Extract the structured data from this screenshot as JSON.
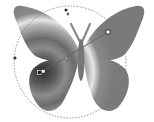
{
  "canvas": {
    "width": 154,
    "height": 122,
    "background": "#ffffff"
  },
  "artwork": {
    "name": "butterfly",
    "fill": "radial-gradient",
    "gradient_stops": [
      "#3a3a3a",
      "#7a7a7a",
      "#dcdcdc",
      "#6e6e6e",
      "#9a9a9a"
    ],
    "body_color": "#777777",
    "antenna_color": "#8a8a8a"
  },
  "gradient_tool": {
    "center": [
      40,
      73
    ],
    "focal": [
      43,
      71
    ],
    "end_handle": [
      108,
      32
    ],
    "rotation_handle": [
      66,
      10
    ],
    "side_handle": [
      15,
      58
    ],
    "radius": 60,
    "line_color": "#555555",
    "ring_color": "#777777"
  }
}
